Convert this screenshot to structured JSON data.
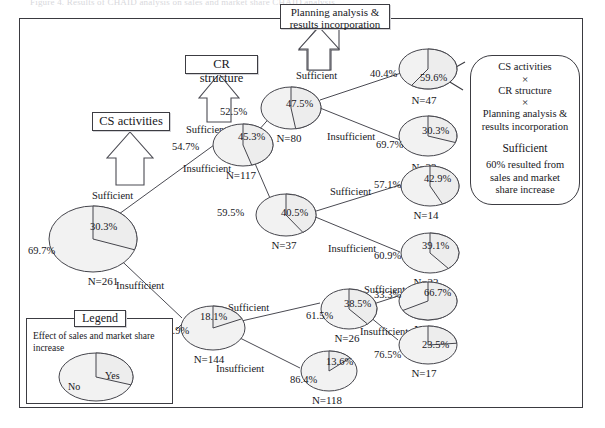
{
  "caption": {
    "text": "Figure 4.  Results of CHAID analysis on sales and market share CHAID analysis",
    "prefix": "Figure 4.",
    "body": "Results of CHAID analysis on sales and market share",
    "emphasis": "CHAID analysis"
  },
  "boxes": {
    "cs_activities": "CS activities",
    "cr_structure": "CR structure",
    "planning": "Planning analysis &\nresults incorporation",
    "planning_line1": "Planning analysis &",
    "planning_line2": "results incorporation"
  },
  "legend": {
    "title": "Legend",
    "description": "Effect of sales and market share increase",
    "yes": "Yes",
    "no": "No",
    "yes_value": 30.3,
    "no_value": 69.7
  },
  "callout": {
    "line1": "CS activities",
    "x1": "×",
    "line2": "CR structure",
    "x2": "×",
    "line3a": "Planning analysis &",
    "line3b": "results incorporation",
    "condition": "Sufficient",
    "result_line1": "60% resulted from",
    "result_line2": "sales and market",
    "result_line3": "share increase"
  },
  "edge_labels": {
    "cs_sufficient": "Sufficient",
    "root_sufficient": "Sufficient",
    "root_insufficient": "Insufficient",
    "cr_sufficient": "Sufficient",
    "cr_insufficient": "Insufficient",
    "mid_sufficient": "Sufficient",
    "mid_insufficient": "Insufficient",
    "low_sufficient": "Sufficient",
    "low_insufficient": "Insufficient",
    "low2_sufficient": "Sufficient",
    "low2_insufficient": "Insufficient",
    "planning_sufficient": "Sufficient"
  },
  "chart_data": {
    "type": "pie",
    "title": "Results of CHAID analysis on sales and market share",
    "legend": [
      "Yes",
      "No"
    ],
    "value_label_suffix": "%",
    "nodes": [
      {
        "id": "root",
        "n_label": "N=261",
        "n": 261,
        "yes": 30.3,
        "no": 69.7,
        "yes_label": "30.3%",
        "no_label": "69.7%"
      },
      {
        "id": "n117",
        "n_label": "N=117",
        "n": 117,
        "yes": 45.3,
        "no": 54.7,
        "yes_label": "45.3%",
        "no_label": "54.7%"
      },
      {
        "id": "n144",
        "n_label": "N=144",
        "n": 144,
        "yes": 18.1,
        "no": 81.9,
        "yes_label": "18.1%",
        "no_label": "81.9%"
      },
      {
        "id": "n80",
        "n_label": "N=80",
        "n": 80,
        "yes": 47.5,
        "no": 52.5,
        "yes_label": "47.5%",
        "no_label": "52.5%"
      },
      {
        "id": "n37",
        "n_label": "N=37",
        "n": 37,
        "yes": 40.5,
        "no": 59.5,
        "yes_label": "40.5%",
        "no_label": "59.5%"
      },
      {
        "id": "n26",
        "n_label": "N=26",
        "n": 26,
        "yes": 38.5,
        "no": 61.5,
        "yes_label": "38.5%",
        "no_label": "61.5%"
      },
      {
        "id": "n118",
        "n_label": "N=118",
        "n": 118,
        "yes": 13.6,
        "no": 86.4,
        "yes_label": "13.6%",
        "no_label": "86.4%"
      },
      {
        "id": "n47",
        "n_label": "N=47",
        "n": 47,
        "yes": 59.6,
        "no": 40.4,
        "yes_label": "59.6%",
        "no_label": "40.4%"
      },
      {
        "id": "n33",
        "n_label": "N=33",
        "n": 33,
        "yes": 30.3,
        "no": 69.7,
        "yes_label": "30.3%",
        "no_label": "69.7%"
      },
      {
        "id": "n14",
        "n_label": "N=14",
        "n": 14,
        "yes": 42.9,
        "no": 57.1,
        "yes_label": "42.9%",
        "no_label": "57.1%"
      },
      {
        "id": "n23",
        "n_label": "N=23",
        "n": 23,
        "yes": 39.1,
        "no": 60.9,
        "yes_label": "39.1%",
        "no_label": "60.9%"
      },
      {
        "id": "n9",
        "n_label": "N=9",
        "n": 9,
        "yes": 66.7,
        "no": 33.3,
        "yes_label": "66.7%",
        "no_label": "33.3%"
      },
      {
        "id": "n17",
        "n_label": "N=17",
        "n": 17,
        "yes": 23.5,
        "no": 76.5,
        "yes_label": "23.5%",
        "no_label": "76.5%"
      }
    ],
    "splits": [
      {
        "parent": "root",
        "variable": "CS activities",
        "children": [
          {
            "id": "n117",
            "branch": "Sufficient"
          },
          {
            "id": "n144",
            "branch": "Insufficient"
          }
        ]
      },
      {
        "parent": "n117",
        "variable": "CR structure",
        "children": [
          {
            "id": "n80",
            "branch": "Sufficient"
          },
          {
            "id": "n37",
            "branch": "Insufficient"
          }
        ]
      },
      {
        "parent": "n144",
        "variable": "CR structure",
        "children": [
          {
            "id": "n26",
            "branch": "Sufficient"
          },
          {
            "id": "n118",
            "branch": "Insufficient"
          }
        ]
      },
      {
        "parent": "n80",
        "variable": "Planning analysis & results incorporation",
        "children": [
          {
            "id": "n47",
            "branch": "Sufficient"
          },
          {
            "id": "n33",
            "branch": "Insufficient"
          }
        ]
      },
      {
        "parent": "n37",
        "variable": "Planning analysis & results incorporation",
        "children": [
          {
            "id": "n14",
            "branch": "Sufficient"
          },
          {
            "id": "n23",
            "branch": "Insufficient"
          }
        ]
      },
      {
        "parent": "n26",
        "variable": "Planning analysis & results incorporation",
        "children": [
          {
            "id": "n9",
            "branch": "Sufficient"
          },
          {
            "id": "n17",
            "branch": "Insufficient"
          }
        ]
      }
    ]
  }
}
